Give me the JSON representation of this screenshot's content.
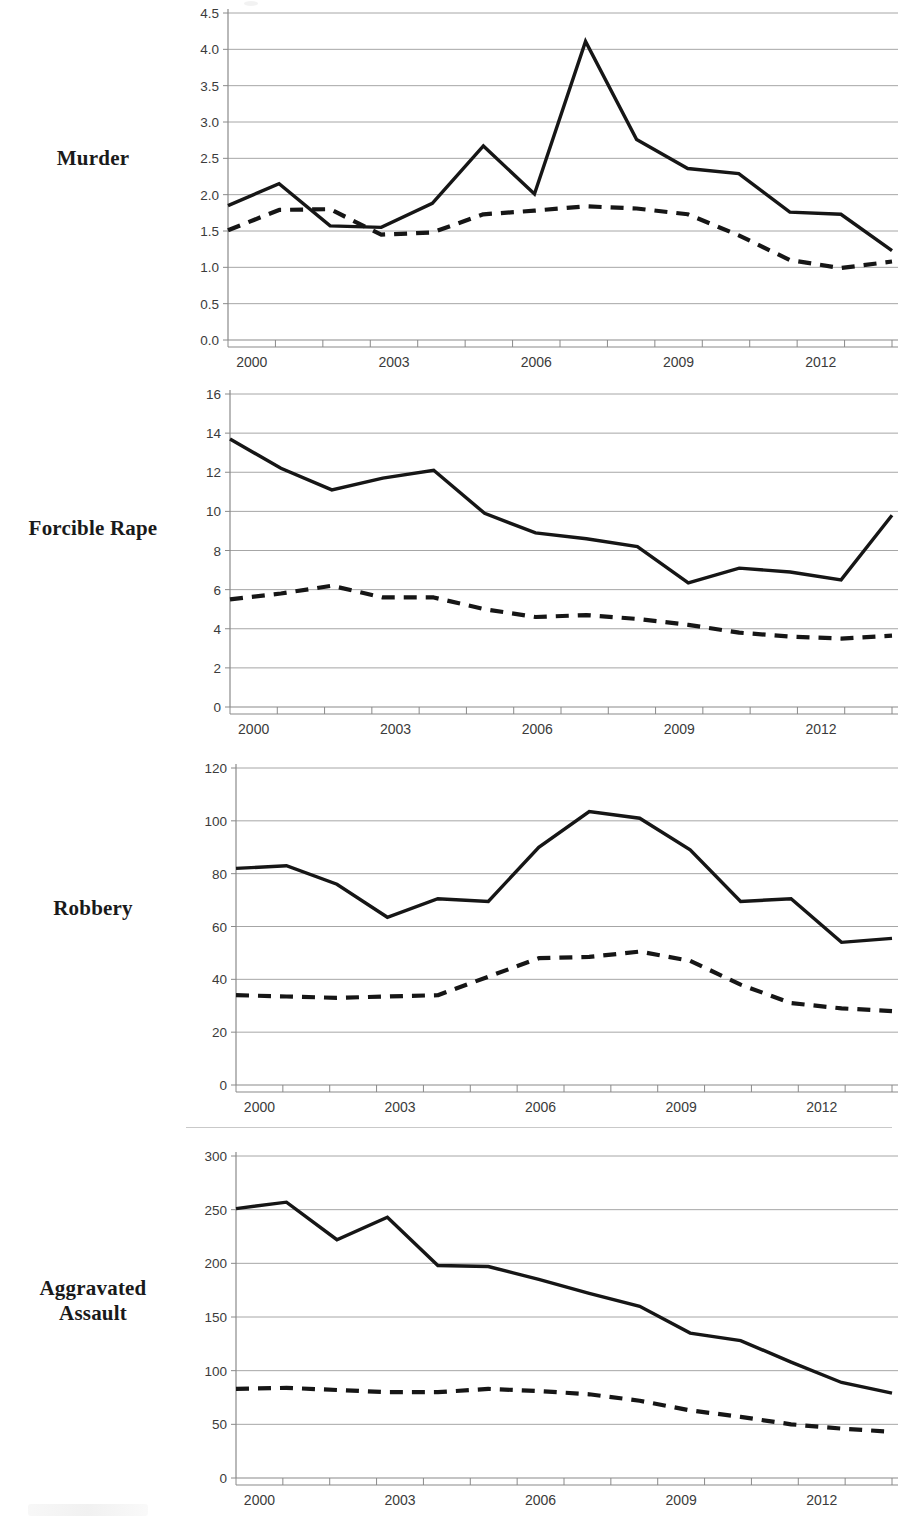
{
  "figure": {
    "background_color": "#ffffff",
    "line_color": "#161616",
    "grid_color": "#a6a6a6",
    "panel_count": 4
  },
  "panels": [
    {
      "label": "Murder",
      "label_lines": [
        "Murder"
      ]
    },
    {
      "label": "Forcible Rape",
      "label_lines": [
        "Forcible Rape"
      ]
    },
    {
      "label": "Robbery",
      "label_lines": [
        "Robbery"
      ]
    },
    {
      "label": "Aggravated Assault",
      "label_lines": [
        "Aggravated",
        "Assault"
      ]
    }
  ],
  "chart_data": [
    {
      "type": "line",
      "title": "Murder",
      "xlabel": "",
      "ylabel": "",
      "grid": true,
      "legend_position": "none",
      "x": [
        2000,
        2001,
        2002,
        2003,
        2004,
        2005,
        2006,
        2007,
        2008,
        2009,
        2010,
        2011,
        2012,
        2013
      ],
      "xtick_labels": [
        "2000",
        "2003",
        "2006",
        "2009",
        "2012"
      ],
      "xtick_values": [
        2000,
        2003,
        2006,
        2009,
        2012
      ],
      "ylim": [
        0.0,
        4.5
      ],
      "ytick_labels": [
        "0.0",
        "0.5",
        "1.0",
        "1.5",
        "2.0",
        "2.5",
        "3.0",
        "3.5",
        "4.0",
        "4.5"
      ],
      "ytick_values": [
        0.0,
        0.5,
        1.0,
        1.5,
        2.0,
        2.5,
        3.0,
        3.5,
        4.0,
        4.5
      ],
      "series": [
        {
          "name": "solid-series",
          "style": "solid",
          "values": [
            1.85,
            2.15,
            1.57,
            1.55,
            1.88,
            2.67,
            2.01,
            4.11,
            2.76,
            2.36,
            2.29,
            1.76,
            1.73,
            1.23
          ]
        },
        {
          "name": "dashed-series",
          "style": "dashed",
          "values": [
            1.51,
            1.79,
            1.8,
            1.45,
            1.48,
            1.73,
            1.78,
            1.84,
            1.81,
            1.73,
            1.44,
            1.1,
            0.99,
            1.08
          ]
        }
      ]
    },
    {
      "type": "line",
      "title": "Forcible Rape",
      "xlabel": "",
      "ylabel": "",
      "grid": true,
      "legend_position": "none",
      "x": [
        2000,
        2001,
        2002,
        2003,
        2004,
        2005,
        2006,
        2007,
        2008,
        2009,
        2010,
        2011,
        2012,
        2013
      ],
      "xtick_labels": [
        "2000",
        "2003",
        "2006",
        "2009",
        "2012"
      ],
      "xtick_values": [
        2000,
        2003,
        2006,
        2009,
        2012
      ],
      "ylim": [
        0,
        16
      ],
      "ytick_labels": [
        "0",
        "2",
        "4",
        "6",
        "8",
        "10",
        "12",
        "14",
        "16"
      ],
      "ytick_values": [
        0,
        2,
        4,
        6,
        8,
        10,
        12,
        14,
        16
      ],
      "series": [
        {
          "name": "solid-series",
          "style": "solid",
          "values": [
            13.7,
            12.2,
            11.1,
            11.7,
            12.1,
            9.9,
            8.9,
            8.6,
            8.2,
            6.35,
            7.1,
            6.9,
            6.5,
            9.8
          ]
        },
        {
          "name": "dashed-series",
          "style": "dashed",
          "values": [
            5.5,
            5.8,
            6.2,
            5.6,
            5.6,
            5.0,
            4.6,
            4.7,
            4.5,
            4.2,
            3.8,
            3.6,
            3.5,
            3.65
          ]
        }
      ]
    },
    {
      "type": "line",
      "title": "Robbery",
      "xlabel": "",
      "ylabel": "",
      "grid": true,
      "legend_position": "none",
      "x": [
        2000,
        2001,
        2002,
        2003,
        2004,
        2005,
        2006,
        2007,
        2008,
        2009,
        2010,
        2011,
        2012,
        2013
      ],
      "xtick_labels": [
        "2000",
        "2003",
        "2006",
        "2009",
        "2012"
      ],
      "xtick_values": [
        2000,
        2003,
        2006,
        2009,
        2012
      ],
      "ylim": [
        0,
        120
      ],
      "ytick_labels": [
        "0",
        "20",
        "40",
        "60",
        "80",
        "100",
        "120"
      ],
      "ytick_values": [
        0,
        20,
        40,
        60,
        80,
        100,
        120
      ],
      "series": [
        {
          "name": "solid-series",
          "style": "solid",
          "values": [
            82,
            83,
            76,
            63.5,
            70.5,
            69.5,
            90,
            103.5,
            101,
            89,
            69.5,
            70.5,
            54,
            55.5
          ]
        },
        {
          "name": "dashed-series",
          "style": "dashed",
          "values": [
            34,
            33.5,
            33,
            33.5,
            34,
            41,
            48,
            48.5,
            50.5,
            47,
            38,
            31,
            29,
            28
          ]
        }
      ]
    },
    {
      "type": "line",
      "title": "Aggravated Assault",
      "xlabel": "",
      "ylabel": "",
      "grid": true,
      "legend_position": "none",
      "x": [
        2000,
        2001,
        2002,
        2003,
        2004,
        2005,
        2006,
        2007,
        2008,
        2009,
        2010,
        2011,
        2012,
        2013
      ],
      "xtick_labels": [
        "2000",
        "2003",
        "2006",
        "2009",
        "2012"
      ],
      "xtick_values": [
        2000,
        2003,
        2006,
        2009,
        2012
      ],
      "ylim": [
        0,
        300
      ],
      "ytick_labels": [
        "0",
        "50",
        "100",
        "150",
        "200",
        "250",
        "300"
      ],
      "ytick_values": [
        0,
        50,
        100,
        150,
        200,
        250,
        300
      ],
      "series": [
        {
          "name": "solid-series",
          "style": "solid",
          "values": [
            251,
            257,
            222,
            243,
            198,
            197,
            185,
            172,
            160,
            135,
            128,
            108,
            89,
            79
          ]
        },
        {
          "name": "dashed-series",
          "style": "dashed",
          "values": [
            83,
            84,
            82,
            80,
            80,
            83,
            81,
            78,
            72,
            63,
            57,
            50,
            46,
            43
          ]
        }
      ]
    }
  ]
}
